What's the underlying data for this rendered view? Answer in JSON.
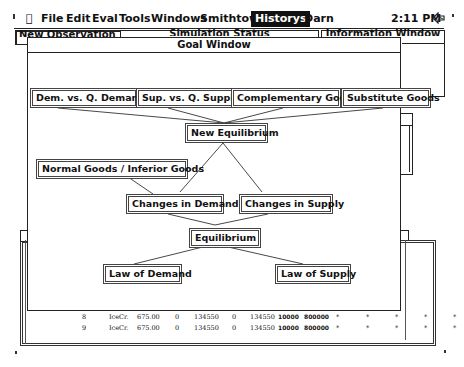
{
  "menubar": {
    "apple": "",
    "items": [
      "File",
      "Edit",
      "Eval",
      "Tools",
      "Windows",
      "Smithtown",
      "Historys",
      "Darn"
    ],
    "active_item": "Historys",
    "clock": "2:11 PM",
    "status_icon": "reply-arrow-icon"
  },
  "background_windows": {
    "new_observation": "New Observation",
    "simulation_status": "Simulation Status",
    "information_window": "Information Window"
  },
  "goal_window": {
    "title": "Goal Window",
    "nodes": {
      "dem_vs_q_demanded": "Dem. vs. Q. Demanded",
      "sup_vs_q_supplied": "Sup. vs. Q. Supplied",
      "complementary_goods": "Complementary Goods",
      "substitute_goods": "Substitute Goods",
      "new_equilibrium": "New Equilibrium",
      "normal_inferior_goods": "Normal Goods / Inferior Goods",
      "changes_in_demand": "Changes in Demand",
      "changes_in_supply": "Changes in Supply",
      "equilibrium": "Equilibrium",
      "law_of_demand": "Law of Demand",
      "law_of_supply": "Law of Supply"
    }
  },
  "history_table": {
    "rows": [
      {
        "n": "8",
        "good": "IceCr.",
        "price": "675.00",
        "c1": "0",
        "c2": "134550",
        "c3": "0",
        "c4": "134550",
        "c5": "10000",
        "c6": "800000",
        "marks": [
          "*",
          "*",
          "*",
          "*",
          "*"
        ]
      },
      {
        "n": "9",
        "good": "IceCr.",
        "price": "675.00",
        "c1": "0",
        "c2": "134550",
        "c3": "0",
        "c4": "134550",
        "c5": "10000",
        "c6": "800000",
        "marks": [
          "*",
          "*",
          "*",
          "*",
          "*"
        ]
      }
    ]
  }
}
